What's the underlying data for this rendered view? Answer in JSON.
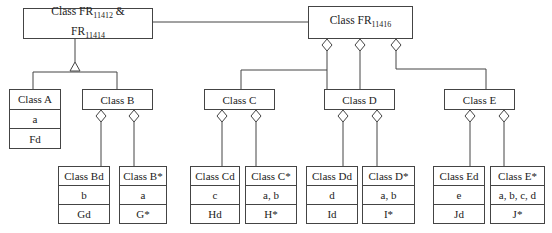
{
  "diagram": {
    "root_left": {
      "name": "Class FR",
      "sub1": "11412",
      "amp": " &",
      "name2": "FR",
      "sub2": "11414"
    },
    "root_right": {
      "name": "Class FR",
      "sub": "11416"
    },
    "classes": {
      "A": {
        "name": "Class A",
        "attr": "a",
        "method": "Fd"
      },
      "B": {
        "name": "Class B"
      },
      "C": {
        "name": "Class C"
      },
      "D": {
        "name": "Class D"
      },
      "E": {
        "name": "Class E"
      },
      "Bd": {
        "name": "Class Bd",
        "attr": "b",
        "method": "Gd"
      },
      "Bs": {
        "name": "Class B*",
        "attr": "a",
        "method": "G*"
      },
      "Cd": {
        "name": "Class Cd",
        "attr": "c",
        "method": "Hd"
      },
      "Cs": {
        "name": "Class C*",
        "attr": "a, b",
        "method": "H*"
      },
      "Dd": {
        "name": "Class Dd",
        "attr": "d",
        "method": "Id"
      },
      "Ds": {
        "name": "Class D*",
        "attr": "a, b",
        "method": "I*"
      },
      "Ed": {
        "name": "Class Ed",
        "attr": "e",
        "method": "Jd"
      },
      "Es": {
        "name": "Class E*",
        "attr": "a, b, c, d",
        "method": "J*"
      }
    }
  }
}
